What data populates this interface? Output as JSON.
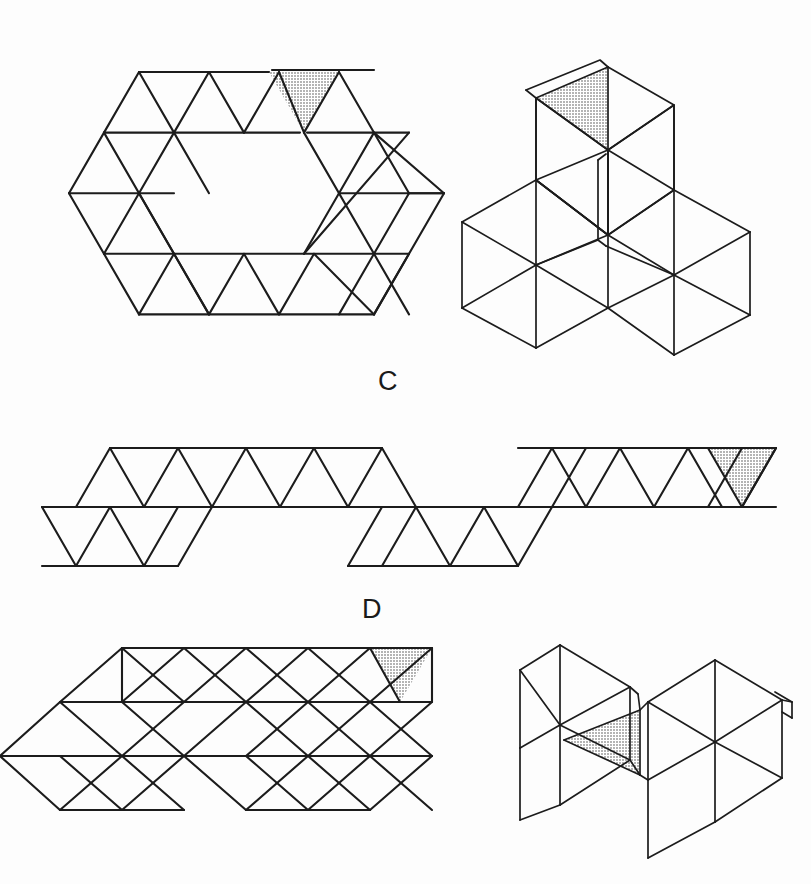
{
  "sheet": {
    "title": "Deltahedron nets and folded solids",
    "width": 811,
    "height": 884,
    "background_color": "#fdfdfd",
    "stroke_color": "#1c1c1c",
    "shaded_face_color": "#c8c8c8"
  },
  "labels": [
    {
      "id": "label-c",
      "text": "C",
      "x": 378,
      "y": 368
    },
    {
      "id": "label-d",
      "text": "D",
      "x": 362,
      "y": 596
    }
  ],
  "figures": [
    {
      "id": "figure-c-net",
      "caption_letter": "C",
      "kind": "net",
      "description": "Hexagonal triangular net, 18 equilateral triangles forming a hexagon outline with a hollow hexagonal center, one shaded triangle at the top",
      "triangle_count": 18,
      "shaded_triangles": 1,
      "shaded_position": "top-right-of-center",
      "outline_shape": "hexagon"
    },
    {
      "id": "figure-c-solid",
      "caption_letter": "C",
      "kind": "folded-solid",
      "description": "Isometric folded deltahedron: three rhombic prism arms radiating in a Y arrangement with an upright arm whose top face is shaded",
      "shaded_triangles": 1,
      "shaded_position": "top-face-of-upright-arm",
      "projection": "isometric"
    },
    {
      "id": "figure-d-net",
      "caption_letter": "D",
      "kind": "net",
      "description": "Long zigzag strip of equilateral triangles stepping from a lower band to an upper band, with the rightmost triangle shaded",
      "triangle_count": 24,
      "shaded_triangles": 1,
      "shaded_position": "far-right-downward-triangle",
      "outline_shape": "strip"
    },
    {
      "id": "figure-d-net-lower",
      "caption_letter": "D",
      "kind": "net",
      "description": "Triangular net of three overlapping hexagon clusters in two rows with one shaded triangle at upper right",
      "triangle_count": 24,
      "shaded_triangles": 1,
      "shaded_position": "upper-right",
      "outline_shape": "three-hexagon-cluster"
    },
    {
      "id": "figure-d-solid",
      "caption_letter": "D",
      "kind": "folded-solid",
      "description": "Isometric folded deltahedron formed from two hexagonal antiprism-like lobes joined at a shaded interior triangle",
      "shaded_triangles": 1,
      "shaded_position": "central-joining-face",
      "projection": "isometric"
    }
  ],
  "geometry": {
    "c_net": {
      "origin_x": 104,
      "origin_y": 72,
      "side": 70,
      "row_height": 60
    },
    "d_strip": {
      "origin_x": 42,
      "origin_y": 448,
      "side": 68,
      "row_height": 59
    },
    "d_lower_net": {
      "origin_x": 60,
      "origin_y": 648,
      "side": 62,
      "row_height": 54
    }
  }
}
